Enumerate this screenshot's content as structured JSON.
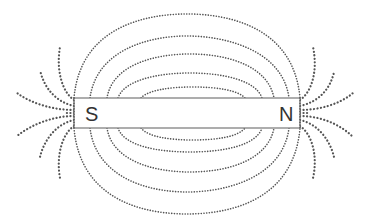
{
  "diagram": {
    "magnet": {
      "left_pole_label": "S",
      "right_pole_label": "N"
    },
    "colors": {
      "field_lines": "#555555",
      "magnet_outline": "#777777",
      "label_text": "#333333",
      "background": "#ffffff"
    },
    "field_loops_above": 5,
    "field_loops_below": 5,
    "fan_lines_per_pole": 6
  }
}
